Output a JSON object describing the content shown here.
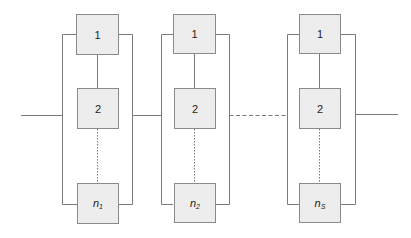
{
  "diagram": {
    "type": "series-parallel reliability block diagram",
    "colors": {
      "box_fill": "#ededed",
      "box_border": "#8a8a8a",
      "line": "#7a7a7a"
    },
    "stages": [
      {
        "id": "stage-1",
        "blocks": [
          {
            "label": "1"
          },
          {
            "label": "2"
          },
          {
            "label": "n",
            "sub": "1"
          }
        ]
      },
      {
        "id": "stage-2",
        "blocks": [
          {
            "label": "1"
          },
          {
            "label": "2"
          },
          {
            "label": "n",
            "sub": "2"
          }
        ]
      },
      {
        "id": "stage-S",
        "blocks": [
          {
            "label": "1"
          },
          {
            "label": "2"
          },
          {
            "label": "n",
            "sub": "S"
          }
        ]
      }
    ],
    "connections": {
      "input": "solid",
      "stage1_to_stage2": "solid",
      "stage2_to_stageS": "dashed",
      "output": "solid",
      "block2_to_blockn": "dotted"
    }
  }
}
